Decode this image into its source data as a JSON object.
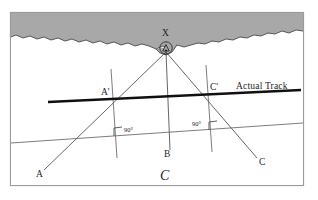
{
  "figure": {
    "caption": "C",
    "frame": {
      "x": 10,
      "y": 12,
      "w": 294,
      "h": 174,
      "border_color": "#9a9a9a"
    },
    "land": {
      "name": "coastline-landmass",
      "fill": "#a8a8a8",
      "stroke": "#3c3c3c"
    },
    "sea": {
      "fill": "#ffffff"
    },
    "landmark": {
      "label": "X",
      "symbol": "circle-with-triangle-beacon",
      "x": 166,
      "y": 48
    },
    "points": [
      {
        "id": "A",
        "label": "A",
        "x": 38,
        "y": 176
      },
      {
        "id": "B",
        "label": "B",
        "x": 166,
        "y": 155
      },
      {
        "id": "C",
        "label": "C",
        "x": 263,
        "y": 164
      },
      {
        "id": "Ap",
        "label": "A'",
        "x": 103,
        "y": 96
      },
      {
        "id": "Cp",
        "label": "C'",
        "x": 212,
        "y": 91
      }
    ],
    "angles": [
      {
        "label": "90°",
        "x": 124,
        "y": 131,
        "marker": "right-angle-square"
      },
      {
        "label": "90°",
        "x": 196,
        "y": 125,
        "marker": "right-angle-square"
      }
    ],
    "track": {
      "label": "Actual Track",
      "label_x": 238,
      "label_y": 88,
      "color": "#101010",
      "width": 2.4
    },
    "bearing_lines": [
      {
        "name": "bearing-X-to-A",
        "from": "X",
        "to": "A"
      },
      {
        "name": "bearing-X-to-B",
        "from": "X",
        "to": "B"
      },
      {
        "name": "bearing-X-to-C",
        "from": "X",
        "to": "C"
      }
    ],
    "colors": {
      "ink": "#1d1d1d",
      "thin_line": "#6e6e6e",
      "land_fill": "#a8a8a8",
      "frame": "#9a9a9a",
      "track": "#101010"
    }
  }
}
